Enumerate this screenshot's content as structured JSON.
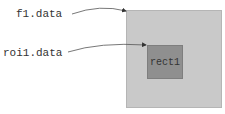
{
  "labels": {
    "f1": "f1.data",
    "roi1": "roi1.data"
  },
  "shapes": {
    "outer": {
      "fill": "#c9c9c9"
    },
    "inner": {
      "label": "rect1",
      "fill": "#8f8f8f"
    }
  }
}
